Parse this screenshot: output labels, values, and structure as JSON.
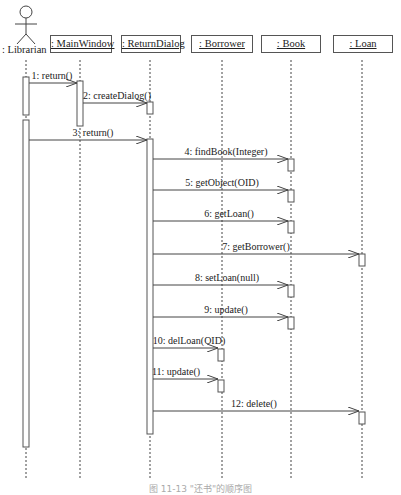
{
  "diagram": {
    "type": "sequence",
    "actor": {
      "label": ": Librarian",
      "icon": "stick-figure-icon"
    },
    "objects": [
      {
        "id": "mainwindow",
        "label": ": MainWindow"
      },
      {
        "id": "returndialog",
        "label": ": ReturnDialog"
      },
      {
        "id": "borrower",
        "label": ": Borrower"
      },
      {
        "id": "book",
        "label": ": Book"
      },
      {
        "id": "loan",
        "label": ": Loan"
      }
    ],
    "messages": [
      {
        "label": "1: return()",
        "from": "librarian",
        "to": "mainwindow"
      },
      {
        "label": "2: createDialog()",
        "from": "mainwindow",
        "to": "returndialog"
      },
      {
        "label": "3: return()",
        "from": "librarian",
        "to": "returndialog"
      },
      {
        "label": "4: findBook(Integer)",
        "from": "returndialog",
        "to": "book"
      },
      {
        "label": "5: getObject(OID)",
        "from": "returndialog",
        "to": "book"
      },
      {
        "label": "6: getLoan()",
        "from": "returndialog",
        "to": "book"
      },
      {
        "label": "7: getBorrower()",
        "from": "returndialog",
        "to": "loan"
      },
      {
        "label": "8: setLoan(null)",
        "from": "returndialog",
        "to": "book"
      },
      {
        "label": "9: update()",
        "from": "returndialog",
        "to": "book"
      },
      {
        "label": "10: delLoan(OID)",
        "from": "returndialog",
        "to": "borrower"
      },
      {
        "label": "11: update()",
        "from": "returndialog",
        "to": "borrower"
      },
      {
        "label": "12: delete()",
        "from": "returndialog",
        "to": "loan"
      }
    ],
    "caption": "图 11-13 \"还书\"的顺序图"
  }
}
